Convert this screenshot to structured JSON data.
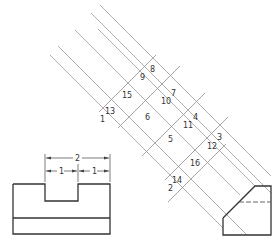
{
  "figure": {
    "colors": {
      "object_line": "#333333",
      "projection_line": "#9a9a9a",
      "background": "#ffffff"
    }
  },
  "front_view": {
    "dimensions": {
      "overall": "2",
      "left_half": "1",
      "right_half": "1"
    }
  },
  "point_labels": [
    {
      "id": "1",
      "text": "1"
    },
    {
      "id": "2",
      "text": "2"
    },
    {
      "id": "3",
      "text": "3"
    },
    {
      "id": "4",
      "text": "4"
    },
    {
      "id": "5",
      "text": "5"
    },
    {
      "id": "6",
      "text": "6"
    },
    {
      "id": "7",
      "text": "7"
    },
    {
      "id": "8",
      "text": "8"
    },
    {
      "id": "9",
      "text": "9"
    },
    {
      "id": "10",
      "text": "10"
    },
    {
      "id": "11",
      "text": "11"
    },
    {
      "id": "12",
      "text": "12"
    },
    {
      "id": "13",
      "text": "13"
    },
    {
      "id": "14",
      "text": "14"
    },
    {
      "id": "15",
      "text": "15"
    },
    {
      "id": "16",
      "text": "16"
    }
  ]
}
